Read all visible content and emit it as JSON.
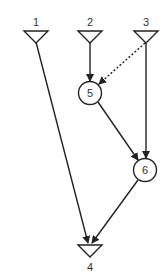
{
  "diagram": {
    "type": "directed-graph",
    "colors": {
      "stroke": "#222222",
      "text": "#333333",
      "background": "#ffffff"
    },
    "nodes": [
      {
        "id": "1",
        "label": "1",
        "shape": "triangle-down",
        "x": 36,
        "y": 37
      },
      {
        "id": "2",
        "label": "2",
        "shape": "triangle-down",
        "x": 90,
        "y": 37
      },
      {
        "id": "3",
        "label": "3",
        "shape": "triangle-down",
        "x": 146,
        "y": 37
      },
      {
        "id": "5",
        "label": "5",
        "shape": "circle",
        "x": 90,
        "y": 93
      },
      {
        "id": "6",
        "label": "6",
        "shape": "circle",
        "x": 145,
        "y": 170
      },
      {
        "id": "4",
        "label": "4",
        "shape": "triangle-down",
        "x": 90,
        "y": 251
      }
    ],
    "edges": [
      {
        "from": "1",
        "to": "4",
        "style": "solid"
      },
      {
        "from": "2",
        "to": "5",
        "style": "solid"
      },
      {
        "from": "3",
        "to": "5",
        "style": "dotted"
      },
      {
        "from": "3",
        "to": "6",
        "style": "solid"
      },
      {
        "from": "5",
        "to": "6",
        "style": "solid"
      },
      {
        "from": "6",
        "to": "4",
        "style": "solid"
      }
    ]
  }
}
